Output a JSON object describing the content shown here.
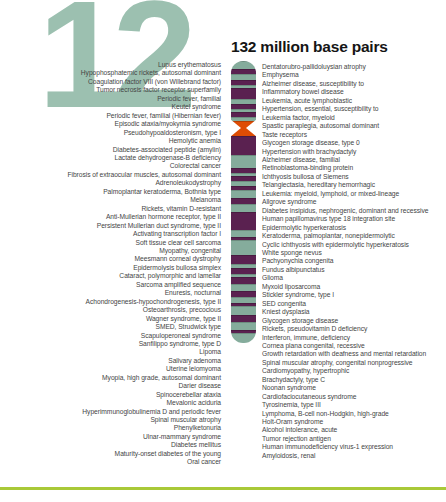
{
  "figure": {
    "chromosome_number": "12",
    "title": "132 million base pairs"
  },
  "colors": {
    "numeral_teal": "#9cc0b0",
    "band_teal": "#85ac9c",
    "band_purple": "#5a2150",
    "centromere_orange": "#de4d04",
    "bottom_rule_green": "#a9c938",
    "list_text": "#454545",
    "title_text": "#151515"
  },
  "chromosome": {
    "bands": [
      {
        "c": "teal",
        "h": 8
      },
      {
        "c": "purple",
        "h": 5
      },
      {
        "c": "teal",
        "h": 6
      },
      {
        "c": "purple",
        "h": 5
      },
      {
        "c": "teal",
        "h": 3
      },
      {
        "c": "purple",
        "h": 11
      },
      {
        "c": "teal",
        "h": 5
      },
      {
        "c": "purple",
        "h": 5
      },
      {
        "c": "teal",
        "h": 3
      },
      {
        "c": "purple",
        "h": 5
      },
      {
        "c": "teal",
        "h": 4
      },
      {
        "c": "orange",
        "h": 15
      },
      {
        "c": "purple",
        "h": 19
      },
      {
        "c": "teal",
        "h": 13
      },
      {
        "c": "purple",
        "h": 5
      },
      {
        "c": "teal",
        "h": 3
      },
      {
        "c": "purple",
        "h": 5
      },
      {
        "c": "teal",
        "h": 5
      },
      {
        "c": "purple",
        "h": 4
      },
      {
        "c": "teal",
        "h": 8
      },
      {
        "c": "purple",
        "h": 6
      },
      {
        "c": "teal",
        "h": 8
      },
      {
        "c": "purple",
        "h": 18
      },
      {
        "c": "teal",
        "h": 7
      },
      {
        "c": "purple",
        "h": 3
      },
      {
        "c": "teal",
        "h": 15
      },
      {
        "c": "purple",
        "h": 9
      },
      {
        "c": "teal",
        "h": 4
      },
      {
        "c": "purple",
        "h": 6
      },
      {
        "c": "teal",
        "h": 3
      },
      {
        "c": "purple",
        "h": 7
      },
      {
        "c": "teal",
        "h": 7
      },
      {
        "c": "purple",
        "h": 6
      },
      {
        "c": "teal",
        "h": 6
      },
      {
        "c": "purple",
        "h": 3
      },
      {
        "c": "teal",
        "h": 9
      },
      {
        "c": "purple",
        "h": 7
      },
      {
        "c": "teal",
        "h": 8
      },
      {
        "c": "purple",
        "h": 3
      },
      {
        "c": "teal",
        "h": 10
      }
    ]
  },
  "left_diseases": [
    "Lupus erythematosus",
    "Hypophosphatemic rickets, autosomal dominant",
    "Coagulation factor VIII (von Willebrand factor)",
    "Tumor necrosis factor receptor superfamily",
    "Periodic fever, familial",
    "Keutel syndrome",
    "Periodic fever, familial (Hibernian fever)",
    "Episodic ataxia/myokymia syndrome",
    "Pseudohypoaldosteronism, type I",
    "Hemolytic anemia",
    "Diabetes-associated peptide (amylin)",
    "Lactate dehydrogenase-B deficiency",
    "Colorectal cancer",
    "Fibrosis of extraocular muscles, autosomal dominant",
    "Adrenoleukodystrophy",
    "Palmoplantar keratoderma, Bothnia type",
    "Melanoma",
    "Rickets, vitamin D-resistant",
    "Anti-Mullerian hormone receptor, type II",
    "Persistent Mullerian duct syndrome, type II",
    "Activating transcription factor I",
    "Soft tissue clear cell sarcoma",
    "Myopathy, congenital",
    "Meesmann corneal dystrophy",
    "Epidermolysis bullosa simplex",
    "Cataract, polymorphic and lamellar",
    "Sarcoma amplified sequence",
    "Enuresis, nocturnal",
    "Achondrogenesis-hypochondrogenesis, type II",
    "Osteoarthrosis, precocious",
    "Wagner syndrome, type II",
    "SMED, Strudwick type",
    "Scapuloperoneal syndrome",
    "Sanfilippo syndrome, type D",
    "Lipoma",
    "Salivary adenoma",
    "Uterine leiomyoma",
    "Myopia, high grade, autosomal dominant",
    "Darier disease",
    "Spinocerebellar ataxia",
    "Mevalonic aciduria",
    "Hyperimmunoglobulinemia D and periodic fever",
    "Spinal muscular atrophy",
    "Phenylketonuria",
    "Ulnar-mammary syndrome",
    "Diabetes mellitus",
    "Maturity-onset diabetes of the young",
    "Oral cancer"
  ],
  "right_diseases": [
    "Dentatorubro-pallidoluysian atrophy",
    "Emphysema",
    "Alzheimer disease, susceptibility to",
    "Inflammatory bowel disease",
    "Leukemia, acute lymphoblastic",
    "Hypertension, essential, susceptibility to",
    "Leukemia factor, myeloid",
    "Spastic paraplegia, autosomal dominant",
    "Taste receptors",
    "Glycogen storage disease, type 0",
    "Hypertension with brachydactyly",
    "Alzheimer disease, familial",
    "Retinoblastoma-binding protein",
    "Ichthyosis bullosa of Siemens",
    "Telangiectasia, hereditary hemorrhagic",
    "Leukemia: myeloid, lymphoid, or mixed-lineage",
    "Allgrove syndrome",
    "Diabetes insipidus, nephrogenic, dominant and recessive",
    "Human papillomavirus type 18 integration site",
    "Epidermolytic hyperkeratosis",
    "Keratoderma, palmoplantar, nonepidermolytic",
    "Cyclic ichthyosis with epidermolytic hyperkeratosis",
    "White sponge nevus",
    "Pachyonychia congenita",
    "Fundus albipunctatus",
    "Glioma",
    "Myxoid liposarcoma",
    "Stickler syndrome, type I",
    "SED congenita",
    "Kniest dysplasia",
    "Glycogen storage disease",
    "Rickets, pseudovitamin D deficiency",
    "Interferon, immune, deficiency",
    "Cornea plana congenital, recessive",
    "Growth retardation with deafness and mental retardation",
    "Spinal muscular atrophy, congenital nonprogressive",
    "Cardiomyopathy, hypertrophic",
    "Brachydactyly, type C",
    "Noonan syndrome",
    "Cardiofaciocutaneous syndrome",
    "Tyrosinemia, type III",
    "Lymphoma, B-cell non-Hodgkin, high-grade",
    "Holt-Oram syndrome",
    "Alcohol intolerance, acute",
    "Tumor rejection antigen",
    "Human immunodeficiency virus-1 expression",
    "Amyloidosis, renal"
  ]
}
